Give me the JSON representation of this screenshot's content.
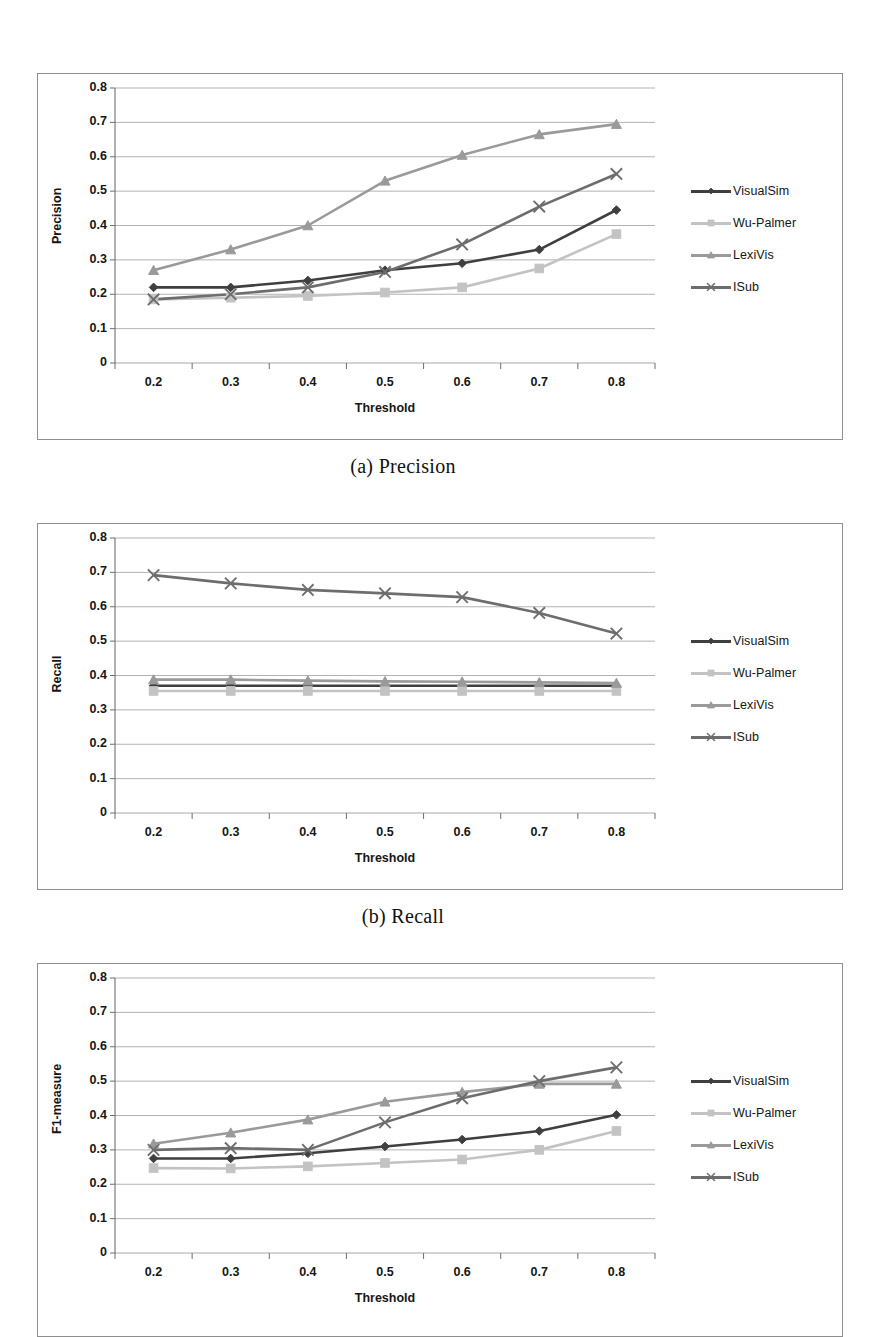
{
  "page": {
    "background": "#ffffff"
  },
  "captions": {
    "a": "(a) Precision",
    "b": "(b) Recall"
  },
  "series_style": {
    "VisualSim": {
      "color": "#3f3f3f",
      "marker": "diamond"
    },
    "Wu-Palmer": {
      "color": "#c3c3c3",
      "marker": "square"
    },
    "LexiVis": {
      "color": "#9a9a9a",
      "marker": "triangle"
    },
    "ISub": {
      "color": "#6d6d6d",
      "marker": "cross"
    }
  },
  "legend_labels": [
    "VisualSim",
    "Wu-Palmer",
    "LexiVis",
    "ISub"
  ],
  "chart_data": [
    {
      "id": "precision",
      "type": "line",
      "title": "",
      "caption": "(a) Precision",
      "xlabel": "Threshold",
      "ylabel": "Precision",
      "x": [
        0.2,
        0.3,
        0.4,
        0.5,
        0.6,
        0.7,
        0.8
      ],
      "xticklabels": [
        "0.2",
        "0.3",
        "0.4",
        "0.5",
        "0.6",
        "0.7",
        "0.8"
      ],
      "yticklabels": [
        "0",
        "0.1",
        "0.2",
        "0.3",
        "0.4",
        "0.5",
        "0.6",
        "0.7",
        "0.8"
      ],
      "ylim": [
        0,
        0.8
      ],
      "ytick_step": 0.1,
      "grid": "horizontal",
      "legend_position": "right",
      "series": [
        {
          "name": "VisualSim",
          "values": [
            0.22,
            0.22,
            0.24,
            0.27,
            0.29,
            0.33,
            0.445
          ]
        },
        {
          "name": "Wu-Palmer",
          "values": [
            0.185,
            0.19,
            0.195,
            0.205,
            0.22,
            0.275,
            0.375
          ]
        },
        {
          "name": "LexiVis",
          "values": [
            0.27,
            0.33,
            0.4,
            0.53,
            0.605,
            0.665,
            0.695
          ]
        },
        {
          "name": "ISub",
          "values": [
            0.185,
            0.2,
            0.22,
            0.265,
            0.345,
            0.455,
            0.55
          ]
        }
      ]
    },
    {
      "id": "recall",
      "type": "line",
      "title": "",
      "caption": "(b) Recall",
      "xlabel": "Threshold",
      "ylabel": "Recall",
      "x": [
        0.2,
        0.3,
        0.4,
        0.5,
        0.6,
        0.7,
        0.8
      ],
      "xticklabels": [
        "0.2",
        "0.3",
        "0.4",
        "0.5",
        "0.6",
        "0.7",
        "0.8"
      ],
      "yticklabels": [
        "0",
        "0.1",
        "0.2",
        "0.3",
        "0.4",
        "0.5",
        "0.6",
        "0.7",
        "0.8"
      ],
      "ylim": [
        0,
        0.8
      ],
      "ytick_step": 0.1,
      "grid": "horizontal",
      "legend_position": "right",
      "series": [
        {
          "name": "VisualSim",
          "values": [
            0.37,
            0.37,
            0.37,
            0.37,
            0.37,
            0.37,
            0.37
          ]
        },
        {
          "name": "Wu-Palmer",
          "values": [
            0.355,
            0.355,
            0.355,
            0.355,
            0.355,
            0.355,
            0.355
          ]
        },
        {
          "name": "LexiVis",
          "values": [
            0.388,
            0.388,
            0.385,
            0.383,
            0.382,
            0.38,
            0.378
          ]
        },
        {
          "name": "ISub",
          "values": [
            0.692,
            0.668,
            0.649,
            0.639,
            0.628,
            0.582,
            0.522
          ]
        }
      ]
    },
    {
      "id": "f1-measure",
      "type": "line",
      "title": "",
      "caption": "",
      "xlabel": "Threshold",
      "ylabel": "F1-measure",
      "x": [
        0.2,
        0.3,
        0.4,
        0.5,
        0.6,
        0.7,
        0.8
      ],
      "xticklabels": [
        "0.2",
        "0.3",
        "0.4",
        "0.5",
        "0.6",
        "0.7",
        "0.8"
      ],
      "yticklabels": [
        "0",
        "0.1",
        "0.2",
        "0.3",
        "0.4",
        "0.5",
        "0.6",
        "0.7",
        "0.8"
      ],
      "ylim": [
        0,
        0.8
      ],
      "ytick_step": 0.1,
      "grid": "horizontal",
      "legend_position": "right",
      "series": [
        {
          "name": "VisualSim",
          "values": [
            0.275,
            0.275,
            0.29,
            0.31,
            0.33,
            0.355,
            0.402
          ]
        },
        {
          "name": "Wu-Palmer",
          "values": [
            0.247,
            0.246,
            0.252,
            0.262,
            0.272,
            0.3,
            0.355
          ]
        },
        {
          "name": "LexiVis",
          "values": [
            0.318,
            0.35,
            0.388,
            0.44,
            0.468,
            0.492,
            0.492
          ]
        },
        {
          "name": "ISub",
          "values": [
            0.3,
            0.305,
            0.3,
            0.38,
            0.45,
            0.5,
            0.54
          ]
        }
      ]
    }
  ]
}
